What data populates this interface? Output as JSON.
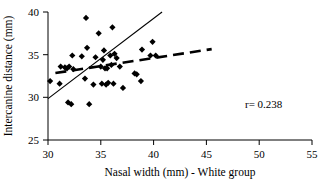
{
  "chart_data": {
    "type": "scatter",
    "title": "",
    "xlabel": "Nasal width (mm) - White group",
    "ylabel": "Intercanine distance (mm)",
    "xlim": [
      30,
      55
    ],
    "ylim": [
      25,
      40
    ],
    "xticks": [
      30,
      35,
      40,
      45,
      50,
      55
    ],
    "yticks": [
      25,
      30,
      35,
      40
    ],
    "grid": false,
    "legend": null,
    "annotations": [
      {
        "name": "correlation",
        "text": "r= 0.238"
      }
    ],
    "points": [
      {
        "x": 30.2,
        "y": 31.9
      },
      {
        "x": 31.1,
        "y": 31.6
      },
      {
        "x": 31.2,
        "y": 33.6
      },
      {
        "x": 31.6,
        "y": 33.5
      },
      {
        "x": 31.8,
        "y": 33.4
      },
      {
        "x": 31.9,
        "y": 29.4
      },
      {
        "x": 32.0,
        "y": 33.6
      },
      {
        "x": 32.2,
        "y": 29.2
      },
      {
        "x": 32.3,
        "y": 34.9
      },
      {
        "x": 32.4,
        "y": 33.3
      },
      {
        "x": 33.2,
        "y": 34.8
      },
      {
        "x": 33.5,
        "y": 32.2
      },
      {
        "x": 33.6,
        "y": 39.3
      },
      {
        "x": 33.7,
        "y": 35.8
      },
      {
        "x": 33.9,
        "y": 29.2
      },
      {
        "x": 34.3,
        "y": 31.5
      },
      {
        "x": 34.5,
        "y": 34.7
      },
      {
        "x": 34.8,
        "y": 37.5
      },
      {
        "x": 35.0,
        "y": 33.6
      },
      {
        "x": 35.1,
        "y": 31.6
      },
      {
        "x": 35.2,
        "y": 34.4
      },
      {
        "x": 35.3,
        "y": 35.5
      },
      {
        "x": 35.4,
        "y": 33.4
      },
      {
        "x": 35.5,
        "y": 31.5
      },
      {
        "x": 35.6,
        "y": 33.4
      },
      {
        "x": 35.7,
        "y": 31.7
      },
      {
        "x": 35.9,
        "y": 34.9
      },
      {
        "x": 36.0,
        "y": 33.8
      },
      {
        "x": 36.1,
        "y": 38.2
      },
      {
        "x": 36.2,
        "y": 31.6
      },
      {
        "x": 36.3,
        "y": 35.1
      },
      {
        "x": 36.5,
        "y": 34.6
      },
      {
        "x": 36.8,
        "y": 33.6
      },
      {
        "x": 37.1,
        "y": 31.1
      },
      {
        "x": 38.2,
        "y": 32.8
      },
      {
        "x": 38.4,
        "y": 32.7
      },
      {
        "x": 38.8,
        "y": 31.9
      },
      {
        "x": 38.9,
        "y": 35.6
      },
      {
        "x": 39.7,
        "y": 34.9
      },
      {
        "x": 39.9,
        "y": 36.5
      },
      {
        "x": 40.2,
        "y": 34.9
      }
    ],
    "trendlines": [
      {
        "name": "solid-regression-line",
        "style": "solid",
        "x0": 30.0,
        "y0": 29.85,
        "x1": 40.8,
        "y1": 40.0
      },
      {
        "name": "dashed-regression-line",
        "style": "dashed",
        "x0": 30.7,
        "y0": 32.85,
        "x1": 45.5,
        "y1": 35.65
      }
    ]
  }
}
